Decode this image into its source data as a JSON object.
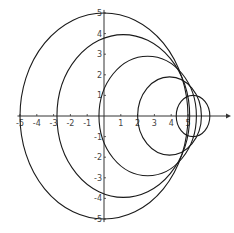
{
  "chart_data": {
    "type": "line",
    "title": "",
    "xlabel": "",
    "ylabel": "",
    "xlim": [
      -5.2,
      7
    ],
    "ylim": [
      -5.2,
      5.2
    ],
    "grid": false,
    "legend": null,
    "x_ticks": [
      -5,
      -4,
      -3,
      -2,
      -1,
      1,
      2,
      3,
      4,
      5
    ],
    "x_tick_labels": [
      "-5",
      "-4",
      "-3",
      "-2",
      "-1",
      "1",
      "2",
      "3",
      "4",
      "5"
    ],
    "y_ticks": [
      5,
      4,
      3,
      2,
      1,
      -1,
      -2,
      -3,
      -4,
      -5
    ],
    "y_tick_labels": [
      "5",
      "4",
      "3",
      "2",
      "1",
      "-1",
      "-2",
      "-3",
      "-4",
      "-5"
    ],
    "series": [
      {
        "name": "circle-1",
        "shape": "circle",
        "cx": 0,
        "cy": 0,
        "r": 5
      },
      {
        "name": "circle-2",
        "shape": "circle",
        "cx": 1.15,
        "cy": 0,
        "r": 3.95
      },
      {
        "name": "circle-3",
        "shape": "circle",
        "cx": 2.6,
        "cy": 0,
        "r": 2.9
      },
      {
        "name": "circle-4",
        "shape": "circle",
        "cx": 3.9,
        "cy": 0,
        "r": 1.9
      },
      {
        "name": "circle-5",
        "shape": "circle",
        "cx": 5.3,
        "cy": 0,
        "r": 1.0
      }
    ],
    "stroke_color": "#1a1a1a",
    "axis_color": "#333333"
  }
}
